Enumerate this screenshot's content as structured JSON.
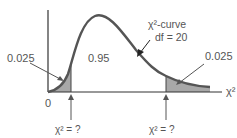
{
  "diagram": {
    "curve_label": "χ²-curve",
    "df_label": "df = 20",
    "center_area": "0.95",
    "left_tail_area": "0.025",
    "right_tail_area": "0.025",
    "origin_label": "0",
    "x_axis_label": "χ²",
    "left_critical_label": "χ² = ?",
    "right_critical_label": "χ² = ?"
  },
  "colors": {
    "curve": "#555555",
    "shade": "#a8a8a8",
    "axis": "#333333",
    "text": "#555555"
  }
}
